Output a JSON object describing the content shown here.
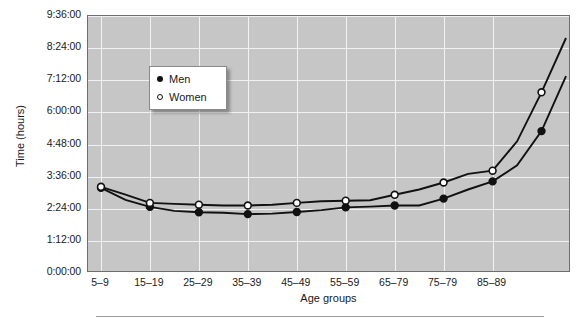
{
  "chart_data": {
    "type": "line",
    "title": "",
    "xlabel": "Age groups",
    "ylabel": "Time (hours)",
    "categories": [
      "5–9",
      "10–14",
      "15–19",
      "20–24",
      "25–29",
      "30–34",
      "35–39",
      "40–44",
      "45–49",
      "50–54",
      "55–59",
      "60–64",
      "65–79",
      "70–74",
      "75–79",
      "80–84",
      "85–89",
      "90+"
    ],
    "xtick_labels": [
      "5–9",
      "15–19",
      "25–29",
      "35–39",
      "45–49",
      "55–59",
      "65–79",
      "75–79",
      "85–89"
    ],
    "ytick_labels": [
      "0:00:00",
      "1:12:00",
      "2:24:00",
      "3:36:00",
      "4:48:00",
      "6:00:00",
      "7:12:00",
      "8:24:00",
      "9:36:00"
    ],
    "ylim_hours": [
      0,
      9.6
    ],
    "ytick_hours": [
      0,
      1.2,
      2.4,
      3.6,
      4.8,
      6.0,
      7.2,
      8.4,
      9.6
    ],
    "grid": true,
    "legend_position": "upper-left-inside",
    "series": [
      {
        "name": "Men",
        "marker": "filled-circle",
        "color": "#111111",
        "values_hours": [
          3.18,
          2.73,
          2.47,
          2.32,
          2.27,
          2.25,
          2.2,
          2.22,
          2.28,
          2.35,
          2.45,
          2.48,
          2.52,
          2.52,
          2.78,
          3.12,
          3.42,
          4.02,
          5.3,
          7.35
        ]
      },
      {
        "name": "Women",
        "marker": "open-circle",
        "color": "#111111",
        "values_hours": [
          3.22,
          2.93,
          2.62,
          2.58,
          2.55,
          2.52,
          2.52,
          2.55,
          2.62,
          2.68,
          2.7,
          2.72,
          2.92,
          3.12,
          3.38,
          3.7,
          3.82,
          4.92,
          6.75,
          8.78
        ]
      }
    ],
    "legend": [
      {
        "label": "Men",
        "marker": "filled-circle"
      },
      {
        "label": "Women",
        "marker": "open-circle"
      }
    ],
    "colors": {
      "plot_background": "#c6c6c6",
      "gridline": "#f2f2f2",
      "axis": "#6e6e6e",
      "series_line": "#111111",
      "legend_background": "#ffffff"
    }
  }
}
